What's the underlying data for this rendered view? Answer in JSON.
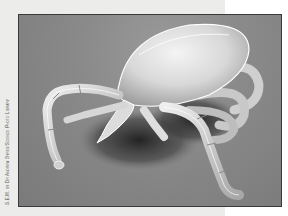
{
  "image": {
    "subject": "Scanning electron micrograph of a tick",
    "credit": "S.E.M. by Dr Andrew Syred/Science Photo Library"
  },
  "colors": {
    "page_background": "#ececea",
    "frame_border": "#3a3a3a",
    "photo_background": "#8a8a8a",
    "tick_highlight": "#f2f2f2",
    "shadow": "#2a2a2a"
  }
}
